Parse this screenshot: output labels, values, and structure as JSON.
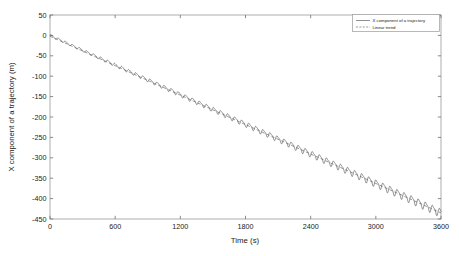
{
  "chart_data": {
    "type": "line",
    "title": "",
    "xlabel": "Time (s)",
    "ylabel": "X component of a trajectory (m)",
    "xlim": [
      0,
      3600
    ],
    "ylim": [
      -450,
      50
    ],
    "xticks": [
      0,
      600,
      1200,
      1800,
      2400,
      3000,
      3600
    ],
    "yticks": [
      50,
      0,
      -50,
      -100,
      -150,
      -200,
      -250,
      -300,
      -350,
      -400,
      -450
    ],
    "xtick_labels": [
      "0",
      "600",
      "1200",
      "1800",
      "2400",
      "3000",
      "3600"
    ],
    "ytick_labels": [
      "50",
      "0",
      "-50",
      "-100",
      "-150",
      "-200",
      "-250",
      "-300",
      "-350",
      "-400",
      "-450"
    ],
    "grid": false,
    "legend_position": "upper right",
    "tick_direction": "in",
    "series": [
      {
        "name": "X component of a trajectory",
        "style": "solid",
        "color": "#4a4a4a",
        "description": "Descending trajectory with superimposed oscillation of growing amplitude",
        "model": {
          "intercept": 0,
          "slope_per_second": -0.1208,
          "oscillation_period_s": 65,
          "oscillation_amplitude_start_m": 3.0,
          "oscillation_amplitude_end_m": 12.0,
          "waveform": "asymmetric sawtooth-like sinusoid"
        },
        "sampled_points": [
          {
            "x": 0,
            "y": 0
          },
          {
            "x": 300,
            "y": -37
          },
          {
            "x": 600,
            "y": -73
          },
          {
            "x": 900,
            "y": -109
          },
          {
            "x": 1200,
            "y": -145
          },
          {
            "x": 1500,
            "y": -181
          },
          {
            "x": 1800,
            "y": -218
          },
          {
            "x": 2100,
            "y": -254
          },
          {
            "x": 2400,
            "y": -290
          },
          {
            "x": 2700,
            "y": -326
          },
          {
            "x": 3000,
            "y": -362
          },
          {
            "x": 3300,
            "y": -399
          },
          {
            "x": 3600,
            "y": -435
          }
        ]
      },
      {
        "name": "Linear trend",
        "style": "dashed",
        "color": "#5a5a5a",
        "description": "Straight-line least-squares fit through the trajectory",
        "model": {
          "intercept": -2,
          "slope_per_second": -0.1203
        },
        "sampled_points": [
          {
            "x": 0,
            "y": -2
          },
          {
            "x": 1800,
            "y": -219
          },
          {
            "x": 3600,
            "y": -435
          }
        ]
      }
    ],
    "legend_entries": [
      {
        "label": "X component of a trajectory",
        "style": "solid"
      },
      {
        "label": "Linear trend",
        "style": "dashed"
      }
    ]
  }
}
